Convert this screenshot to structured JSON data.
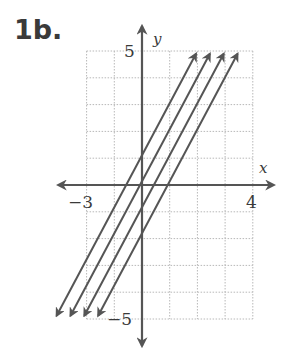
{
  "problem": {
    "label": "1b."
  },
  "chart_data": {
    "type": "line",
    "title": "",
    "xlabel": "x",
    "ylabel": "y",
    "xlim": [
      -2,
      4
    ],
    "ylim": [
      -5,
      5
    ],
    "grid": true,
    "tick_labels": {
      "x_min": "−3",
      "x_max": "4",
      "y_max": "5",
      "y_min": "−5"
    },
    "series": [
      {
        "name": "y = 2x + 1",
        "slope": 2,
        "intercept": 1
      },
      {
        "name": "y = 2x",
        "slope": 2,
        "intercept": 0
      },
      {
        "name": "y = 2x − 1",
        "slope": 2,
        "intercept": -1
      },
      {
        "name": "y = 2x − 2",
        "slope": 2,
        "intercept": -2
      }
    ],
    "colors": {
      "line": "#555555",
      "grid": "#b8b8b8",
      "axis": "#555555"
    }
  }
}
